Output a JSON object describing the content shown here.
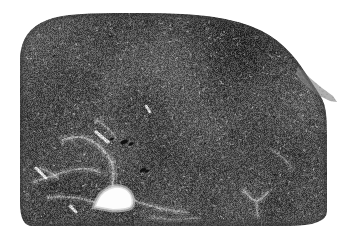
{
  "figure": {
    "kind": "histology-micrograph",
    "modality": "brightfield-light-microscopy",
    "staining_appearance": "grayscale",
    "caption": "",
    "width_px": 342,
    "height_px": 238,
    "background_color": "#ffffff"
  },
  "image": {
    "title": "Grayscale histological section of parenchymal tissue with central vascular lumen",
    "alt_text": "Low magnification grayscale micrograph of a rounded tissue section showing dense speckled parenchyma, pale radiating fibrous septa, and an empty white vessel lumen near the lower left of center.",
    "tone": {
      "tissue_base": "#4e4e4e",
      "tissue_dark": "#303030",
      "tissue_light": "#8c8c8c",
      "septa_color": "#b4b4b4",
      "lumen_color": "#fdfdfd",
      "artifact_color": "#101010",
      "edge_halo": "#c9c9c9"
    },
    "noise": {
      "grain_density": 0.55,
      "grain_contrast": 62,
      "speck_count": 7000,
      "speck_light_ratio": 0.52
    }
  },
  "tissue_outline": {
    "description": "Rounded upper-left corner, gently domed top margin, vertical right margin with a thin tapering tail at upper right, flat bottom margin with narrow white strip below.",
    "margins": {
      "left_px": 20,
      "right_px": 327,
      "top_px": 13,
      "bottom_px": 226
    },
    "polygon": [
      [
        20,
        55
      ],
      [
        22,
        44
      ],
      [
        27,
        34
      ],
      [
        35,
        26
      ],
      [
        46,
        20
      ],
      [
        60,
        16
      ],
      [
        78,
        14
      ],
      [
        100,
        13
      ],
      [
        130,
        13
      ],
      [
        165,
        13
      ],
      [
        200,
        15
      ],
      [
        228,
        19
      ],
      [
        252,
        26
      ],
      [
        270,
        35
      ],
      [
        284,
        46
      ],
      [
        296,
        59
      ],
      [
        305,
        72
      ],
      [
        312,
        83
      ],
      [
        318,
        92
      ],
      [
        323,
        100
      ],
      [
        326,
        110
      ],
      [
        327,
        126
      ],
      [
        327,
        160
      ],
      [
        327,
        196
      ],
      [
        327,
        226
      ],
      [
        250,
        226
      ],
      [
        170,
        226
      ],
      [
        96,
        226
      ],
      [
        44,
        226
      ],
      [
        20,
        226
      ],
      [
        20,
        180
      ],
      [
        20,
        120
      ]
    ],
    "tail": {
      "description": "Thin pale membranous tail extending to the upper right margin",
      "polygon": [
        [
          298,
          66
        ],
        [
          310,
          78
        ],
        [
          322,
          88
        ],
        [
          333,
          96
        ],
        [
          337,
          102
        ],
        [
          330,
          101
        ],
        [
          316,
          94
        ],
        [
          304,
          84
        ],
        [
          296,
          74
        ]
      ]
    }
  },
  "features": {
    "lumen": {
      "name": "vascular-lumen",
      "label": "Empty vessel lumen",
      "center_px": [
        113,
        198
      ],
      "polygon": [
        [
          96,
          206
        ],
        [
          100,
          196
        ],
        [
          109,
          189
        ],
        [
          120,
          187
        ],
        [
          129,
          192
        ],
        [
          132,
          200
        ],
        [
          131,
          207
        ],
        [
          120,
          209
        ],
        [
          106,
          209
        ]
      ],
      "fill": "#fdfdfd"
    },
    "septa": [
      {
        "name": "septum-upper-left",
        "path": [
          [
            62,
            140
          ],
          [
            78,
            136
          ],
          [
            92,
            140
          ],
          [
            104,
            150
          ],
          [
            112,
            162
          ]
        ],
        "width": 2.2,
        "opacity": 0.55
      },
      {
        "name": "septum-radiating-left",
        "path": [
          [
            34,
            182
          ],
          [
            52,
            176
          ],
          [
            70,
            170
          ],
          [
            86,
            168
          ],
          [
            100,
            172
          ]
        ],
        "width": 2.0,
        "opacity": 0.5
      },
      {
        "name": "septum-to-lumen",
        "path": [
          [
            112,
            162
          ],
          [
            114,
            176
          ],
          [
            112,
            188
          ]
        ],
        "width": 2.4,
        "opacity": 0.6
      },
      {
        "name": "septum-right-of-lumen",
        "path": [
          [
            133,
            200
          ],
          [
            150,
            206
          ],
          [
            168,
            210
          ],
          [
            186,
            212
          ]
        ],
        "width": 2.0,
        "opacity": 0.45
      },
      {
        "name": "septum-left-of-lumen",
        "path": [
          [
            94,
            202
          ],
          [
            78,
            198
          ],
          [
            62,
            196
          ],
          [
            48,
            198
          ]
        ],
        "width": 2.0,
        "opacity": 0.45
      },
      {
        "name": "septum-v-lower-right",
        "path": [
          [
            244,
            190
          ],
          [
            256,
            204
          ],
          [
            268,
            192
          ]
        ],
        "width": 2.0,
        "opacity": 0.5
      },
      {
        "name": "septum-lower-right-tail",
        "path": [
          [
            256,
            204
          ],
          [
            258,
            216
          ]
        ],
        "width": 1.8,
        "opacity": 0.4
      },
      {
        "name": "septum-mid-left",
        "path": [
          [
            40,
            168
          ],
          [
            50,
            172
          ],
          [
            58,
            178
          ]
        ],
        "width": 1.8,
        "opacity": 0.45
      },
      {
        "name": "septum-upper-mid",
        "path": [
          [
            96,
            120
          ],
          [
            108,
            128
          ],
          [
            116,
            138
          ]
        ],
        "width": 1.6,
        "opacity": 0.35
      },
      {
        "name": "septum-right-mid",
        "path": [
          [
            272,
            150
          ],
          [
            284,
            158
          ],
          [
            292,
            168
          ]
        ],
        "width": 1.6,
        "opacity": 0.3
      },
      {
        "name": "septum-bottom-mid",
        "path": [
          [
            150,
            218
          ],
          [
            172,
            220
          ],
          [
            196,
            218
          ]
        ],
        "width": 1.6,
        "opacity": 0.3
      }
    ],
    "bright_streaks": [
      {
        "name": "streak-left-margin",
        "from": [
          36,
          168
        ],
        "to": [
          46,
          178
        ],
        "width": 3.0
      },
      {
        "name": "streak-above-lumen",
        "from": [
          96,
          132
        ],
        "to": [
          108,
          142
        ],
        "width": 3.2
      },
      {
        "name": "streak-lumen-left",
        "from": [
          70,
          206
        ],
        "to": [
          76,
          212
        ],
        "width": 3.0
      },
      {
        "name": "streak-mid-top",
        "from": [
          146,
          106
        ],
        "to": [
          150,
          112
        ],
        "width": 2.6
      }
    ],
    "artifacts": [
      {
        "name": "dark-speck-a",
        "center_px": [
          124,
          142
        ],
        "radius": 2.6
      },
      {
        "name": "dark-speck-b",
        "center_px": [
          131,
          144
        ],
        "radius": 1.8
      },
      {
        "name": "dark-speck-c",
        "center_px": [
          143,
          170
        ],
        "radius": 2.2
      },
      {
        "name": "dark-speck-d",
        "center_px": [
          147,
          171
        ],
        "radius": 1.6
      },
      {
        "name": "dark-speck-e",
        "center_px": [
          112,
          139
        ],
        "radius": 1.4
      }
    ]
  },
  "annotations": {
    "scale_bar": null,
    "labels": [],
    "arrows": []
  }
}
